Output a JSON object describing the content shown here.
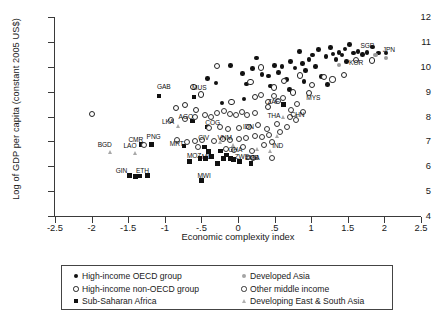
{
  "chart_data": {
    "type": "scatter",
    "title": "",
    "xlabel": "Economic complexity index",
    "ylabel": "Log of GDP per capita (constant 2005 US$)",
    "xlim": [
      -2.5,
      2.5
    ],
    "ylim": [
      4,
      12
    ],
    "xticks": [
      "-2.5",
      "-2",
      "-1.5",
      "-1",
      "-.5",
      "0",
      ".5",
      "1",
      "1.5",
      "2",
      "2.5"
    ],
    "xtick_values": [
      -2.5,
      -2,
      -1.5,
      -1,
      -0.5,
      0,
      0.5,
      1,
      1.5,
      2,
      2.5
    ],
    "yticks": [
      "4",
      "5",
      "6",
      "7",
      "8",
      "9",
      "10",
      "11",
      "12"
    ],
    "ytick_values": [
      4,
      5,
      6,
      7,
      8,
      9,
      10,
      11,
      12
    ],
    "grid": false,
    "legend_position": "below-axis",
    "series": [
      {
        "name": "High-income OECD group",
        "marker": "filled-circle",
        "color": "#111111",
        "points": [
          [
            -0.1,
            10.05
          ],
          [
            0.06,
            9.72
          ],
          [
            0.2,
            9.92
          ],
          [
            0.25,
            10.35
          ],
          [
            0.33,
            9.7
          ],
          [
            0.42,
            9.62
          ],
          [
            0.5,
            10.05
          ],
          [
            0.55,
            9.78
          ],
          [
            0.6,
            10.02
          ],
          [
            0.66,
            9.48
          ],
          [
            0.72,
            10.2
          ],
          [
            0.78,
            9.95
          ],
          [
            0.84,
            10.62
          ],
          [
            0.88,
            10.12
          ],
          [
            0.92,
            9.86
          ],
          [
            0.97,
            10.3
          ],
          [
            1.02,
            10.48
          ],
          [
            1.06,
            10.0
          ],
          [
            1.1,
            10.7
          ],
          [
            1.14,
            9.6
          ],
          [
            1.2,
            10.42
          ],
          [
            1.26,
            10.78
          ],
          [
            1.3,
            10.52
          ],
          [
            1.34,
            10.3
          ],
          [
            1.38,
            10.58
          ],
          [
            1.42,
            10.48
          ],
          [
            1.46,
            10.72
          ],
          [
            1.52,
            10.9
          ],
          [
            1.58,
            10.55
          ],
          [
            1.64,
            10.62
          ],
          [
            1.7,
            10.5
          ],
          [
            1.76,
            10.58
          ],
          [
            1.84,
            10.8
          ],
          [
            1.92,
            10.55
          ],
          [
            2.02,
            10.56
          ],
          [
            -0.42,
            9.52
          ],
          [
            -0.3,
            9.35
          ],
          [
            0.12,
            9.3
          ],
          [
            0.44,
            9.22
          ],
          [
            0.7,
            9.08
          ],
          [
            0.9,
            9.4
          ],
          [
            1.22,
            9.28
          ],
          [
            1.48,
            10.2
          ],
          [
            -0.22,
            8.55
          ],
          [
            0.08,
            8.7
          ]
        ]
      },
      {
        "name": "High-income non-OECD group",
        "marker": "hollow-circle",
        "color": "#222222",
        "points": [
          [
            -2.0,
            8.12
          ],
          [
            -0.62,
            9.22
          ],
          [
            -0.3,
            10.05
          ],
          [
            0.16,
            9.42
          ],
          [
            0.3,
            10.0
          ],
          [
            0.48,
            9.2
          ],
          [
            0.62,
            9.45
          ],
          [
            0.84,
            9.68
          ],
          [
            1.0,
            9.3
          ],
          [
            1.16,
            9.62
          ],
          [
            1.28,
            9.52
          ],
          [
            1.44,
            9.7
          ],
          [
            -0.52,
            8.92
          ],
          [
            -0.1,
            8.6
          ],
          [
            0.22,
            8.82
          ],
          [
            0.74,
            9.0
          ],
          [
            1.6,
            10.3
          ],
          [
            1.82,
            10.28
          ],
          [
            0.4,
            8.4
          ],
          [
            0.96,
            8.98
          ],
          [
            -0.74,
            8.48
          ],
          [
            -0.58,
            8.3
          ],
          [
            -0.86,
            8.38
          ]
        ]
      },
      {
        "name": "Sub-Saharan Africa",
        "marker": "filled-square",
        "color": "#111111",
        "points": [
          [
            -1.08,
            8.82
          ],
          [
            -0.6,
            8.78
          ],
          [
            -0.62,
            7.82
          ],
          [
            -0.42,
            7.58
          ],
          [
            -1.32,
            6.88
          ],
          [
            -1.18,
            6.88
          ],
          [
            -0.74,
            6.82
          ],
          [
            -0.46,
            6.78
          ],
          [
            -0.4,
            6.6
          ],
          [
            -0.52,
            6.32
          ],
          [
            -0.44,
            6.3
          ],
          [
            -0.36,
            6.38
          ],
          [
            -0.24,
            6.62
          ],
          [
            -0.16,
            6.46
          ],
          [
            -0.2,
            6.32
          ],
          [
            -0.1,
            6.3
          ],
          [
            -0.06,
            6.26
          ],
          [
            -1.48,
            5.62
          ],
          [
            -1.34,
            5.6
          ],
          [
            -1.4,
            5.58
          ],
          [
            -1.24,
            5.62
          ],
          [
            -0.5,
            5.42
          ],
          [
            0.02,
            6.2
          ],
          [
            0.18,
            6.12
          ],
          [
            0.62,
            8.48
          ],
          [
            -0.28,
            6.1
          ],
          [
            -0.66,
            6.18
          ]
        ]
      },
      {
        "name": "Developed Asia",
        "marker": "gray-circle",
        "color": "#9a9a9a",
        "points": [
          [
            1.38,
            10.06
          ],
          [
            2.02,
            10.34
          ],
          [
            1.88,
            10.48
          ]
        ]
      },
      {
        "name": "Other middle income",
        "marker": "small-hollow-circle",
        "color": "#333333",
        "points": [
          [
            -0.92,
            7.9
          ],
          [
            -0.74,
            7.92
          ],
          [
            -0.6,
            8.02
          ],
          [
            -0.46,
            8.08
          ],
          [
            -0.38,
            8.02
          ],
          [
            -0.3,
            8.18
          ],
          [
            -0.2,
            8.24
          ],
          [
            -0.12,
            8.14
          ],
          [
            -0.04,
            8.1
          ],
          [
            0.04,
            8.22
          ],
          [
            0.12,
            8.08
          ],
          [
            0.22,
            8.16
          ],
          [
            -0.84,
            7.08
          ],
          [
            -0.7,
            7.02
          ],
          [
            -0.6,
            7.06
          ],
          [
            -0.5,
            7.1
          ],
          [
            -0.34,
            7.04
          ],
          [
            -0.22,
            7.14
          ],
          [
            -0.12,
            7.1
          ],
          [
            0.0,
            7.12
          ],
          [
            0.1,
            7.18
          ],
          [
            0.22,
            7.24
          ],
          [
            0.32,
            7.2
          ],
          [
            0.42,
            7.3
          ],
          [
            -0.18,
            6.72
          ],
          [
            -0.06,
            6.7
          ],
          [
            0.06,
            6.8
          ],
          [
            0.18,
            6.66
          ],
          [
            0.34,
            6.88
          ],
          [
            0.46,
            7.0
          ],
          [
            0.56,
            7.42
          ],
          [
            0.66,
            7.6
          ],
          [
            0.4,
            8.6
          ],
          [
            0.54,
            8.64
          ],
          [
            0.48,
            8.86
          ],
          [
            0.6,
            8.76
          ],
          [
            0.72,
            8.3
          ],
          [
            0.8,
            8.52
          ],
          [
            0.88,
            8.22
          ],
          [
            0.3,
            8.88
          ],
          [
            0.26,
            7.7
          ],
          [
            0.14,
            7.62
          ],
          [
            0.0,
            7.58
          ],
          [
            -0.14,
            7.52
          ],
          [
            -0.26,
            7.62
          ],
          [
            -0.4,
            7.56
          ],
          [
            0.38,
            7.52
          ],
          [
            0.52,
            7.72
          ],
          [
            -0.56,
            6.8
          ],
          [
            -1.3,
            6.9
          ],
          [
            0.7,
            8.0
          ],
          [
            0.78,
            7.88
          ],
          [
            0.2,
            6.34
          ],
          [
            0.46,
            6.36
          ]
        ]
      },
      {
        "name": "Developing East & South Asia",
        "marker": "gray-triangle",
        "color": "#a8a8a8",
        "points": [
          [
            -1.74,
            6.56
          ],
          [
            -1.4,
            6.54
          ],
          [
            -0.82,
            7.6
          ],
          [
            -0.24,
            6.96
          ],
          [
            -0.06,
            6.86
          ],
          [
            0.26,
            6.7
          ],
          [
            0.44,
            6.62
          ],
          [
            0.62,
            7.98
          ],
          [
            0.8,
            8.04
          ],
          [
            0.54,
            7.2
          ]
        ]
      }
    ],
    "point_labels": [
      {
        "code": "GAB",
        "x": -1.08,
        "y": 8.82,
        "dx": -2,
        "dy": -9
      },
      {
        "code": "MUS",
        "x": -0.6,
        "y": 8.78,
        "dx": -2,
        "dy": -9
      },
      {
        "code": "AGO",
        "x": -0.62,
        "y": 7.82,
        "dx": -14,
        "dy": -4
      },
      {
        "code": "LKA",
        "x": -0.82,
        "y": 7.6,
        "dx": -16,
        "dy": -4
      },
      {
        "code": "COG",
        "x": -0.42,
        "y": 7.58,
        "dx": -2,
        "dy": -4
      },
      {
        "code": "IDN",
        "x": 0.04,
        "y": 7.44,
        "dx": 2,
        "dy": -3
      },
      {
        "code": "CMR",
        "x": -1.32,
        "y": 6.88,
        "dx": -13,
        "dy": -4
      },
      {
        "code": "PNG",
        "x": -1.18,
        "y": 6.88,
        "dx": -5,
        "dy": -7
      },
      {
        "code": "MRT",
        "x": -0.74,
        "y": 6.82,
        "dx": -14,
        "dy": -2
      },
      {
        "code": "CIV",
        "x": -0.46,
        "y": 6.96,
        "dx": -6,
        "dy": -4
      },
      {
        "code": "VNM",
        "x": -0.24,
        "y": 6.96,
        "dx": -3,
        "dy": -4
      },
      {
        "code": "GHA",
        "x": -0.16,
        "y": 6.6,
        "dx": 2,
        "dy": -1
      },
      {
        "code": "BGD",
        "x": -1.74,
        "y": 6.56,
        "dx": -13,
        "dy": -7
      },
      {
        "code": "LAO",
        "x": -1.4,
        "y": 6.54,
        "dx": -12,
        "dy": -7
      },
      {
        "code": "MOZ",
        "x": -0.52,
        "y": 6.32,
        "dx": -13,
        "dy": -2
      },
      {
        "code": "MLI",
        "x": -0.44,
        "y": 6.3,
        "dx": -4,
        "dy": -2
      },
      {
        "code": "ZWE",
        "x": -0.1,
        "y": 6.3,
        "dx": 4,
        "dy": -2
      },
      {
        "code": "UGA",
        "x": 0.02,
        "y": 6.2,
        "dx": 6,
        "dy": -3
      },
      {
        "code": "GIN",
        "x": -1.48,
        "y": 5.62,
        "dx": -14,
        "dy": -5
      },
      {
        "code": "ETH",
        "x": -1.34,
        "y": 5.6,
        "dx": -4,
        "dy": -5
      },
      {
        "code": "MWI",
        "x": -0.5,
        "y": 5.42,
        "dx": -4,
        "dy": -5
      },
      {
        "code": "ZMB",
        "x": 0.18,
        "y": 6.12,
        "dx": -6,
        "dy": -5
      },
      {
        "code": "IND",
        "x": 0.44,
        "y": 6.62,
        "dx": 2,
        "dy": -5
      },
      {
        "code": "ZAF",
        "x": 0.62,
        "y": 8.48,
        "dx": -16,
        "dy": -3
      },
      {
        "code": "THA",
        "x": 0.62,
        "y": 7.98,
        "dx": -16,
        "dy": -1
      },
      {
        "code": "CHN",
        "x": 0.8,
        "y": 8.04,
        "dx": -6,
        "dy": -1
      },
      {
        "code": "MYS",
        "x": 0.96,
        "y": 8.52,
        "dx": -2,
        "dy": -6
      },
      {
        "code": "SGP",
        "x": 1.7,
        "y": 10.5,
        "dx": -2,
        "dy": -8
      },
      {
        "code": "KOR",
        "x": 1.6,
        "y": 10.06,
        "dx": -6,
        "dy": -2
      },
      {
        "code": "JPN",
        "x": 2.02,
        "y": 10.34,
        "dx": -3,
        "dy": -8
      }
    ]
  },
  "legend": {
    "left_column": [
      {
        "marker": "filled-circle",
        "label": "High-income OECD group"
      },
      {
        "marker": "hollow-circle",
        "label": "High-income non-OECD group"
      },
      {
        "marker": "filled-square",
        "label": "Sub-Saharan Africa"
      }
    ],
    "right_column": [
      {
        "marker": "gray-circle",
        "label": "Developed Asia"
      },
      {
        "marker": "small-hollow-circle",
        "label": "Other middle income"
      },
      {
        "marker": "gray-triangle",
        "label": "Developing East & South Asia"
      }
    ]
  },
  "colors": {
    "oecd": "#111111",
    "nonoecd": "#222222",
    "ssa": "#111111",
    "developed_asia": "#9a9a9a",
    "other_middle": "#333333",
    "developing_asia": "#a8a8a8",
    "axis": "#3a3a3a"
  }
}
